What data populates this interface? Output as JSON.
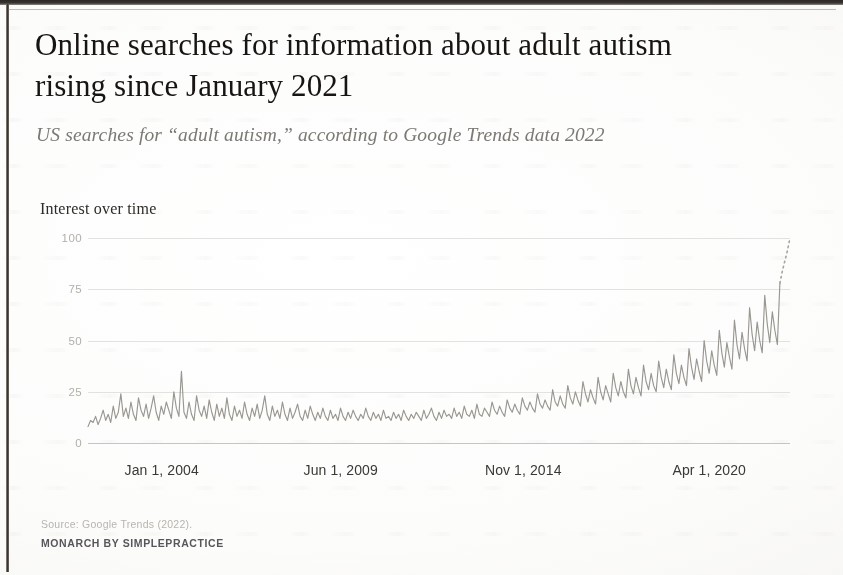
{
  "page": {
    "title_line1": "Online searches for information about adult autism",
    "title_line2": "rising since January 2021",
    "subtitle": "US searches for “adult autism,” according to Google Trends data 2022",
    "chart_caption": "Interest over time",
    "source_note": "Source: Google Trends (2022).",
    "brand_note": "MONARCH BY SIMPLEPRACTICE"
  },
  "colors": {
    "title": "#16120f",
    "subtitle": "#7c7873",
    "line": "#9a9791",
    "grid": "#e6e4e1",
    "axis": "#c9c6c2",
    "ytick": "#b4b0ab",
    "xtick": "#3a3834",
    "source": "#b9b5b0",
    "brand": "#57555a",
    "paper": "#fdfdfc",
    "edge": "#2b2724"
  },
  "chart_data": {
    "type": "line",
    "title": "Interest over time",
    "xlabel": "",
    "ylabel": "Interest over time",
    "ylim": [
      0,
      100
    ],
    "yticks": [
      100,
      75,
      50,
      25,
      0
    ],
    "grid": true,
    "legend": "none",
    "xticks": [
      "Jan 1, 2004",
      "Jun 1, 2009",
      "Nov 1, 2014",
      "Apr 1, 2020"
    ],
    "xtick_positions_pct": [
      10.5,
      36.0,
      62.0,
      88.5
    ],
    "x_start": "Jan 1, 2004",
    "x_end": "2022",
    "annotation": "Final segment drawn as a dotted line (partial/incomplete data), rising to 100.",
    "series": [
      {
        "name": "US search interest for \"adult autism\"",
        "style": "solid",
        "values": [
          8,
          11,
          10,
          13,
          9,
          12,
          16,
          11,
          14,
          10,
          18,
          12,
          15,
          24,
          13,
          17,
          12,
          20,
          14,
          11,
          22,
          16,
          13,
          19,
          12,
          17,
          23,
          15,
          11,
          18,
          14,
          20,
          16,
          12,
          25,
          17,
          13,
          35,
          15,
          12,
          20,
          14,
          11,
          23,
          16,
          13,
          18,
          12,
          21,
          15,
          11,
          19,
          13,
          17,
          12,
          22,
          14,
          11,
          18,
          13,
          16,
          12,
          20,
          14,
          11,
          17,
          13,
          19,
          12,
          16,
          23,
          14,
          11,
          18,
          13,
          16,
          12,
          20,
          14,
          11,
          17,
          12,
          15,
          19,
          13,
          11,
          16,
          12,
          18,
          14,
          11,
          15,
          12,
          17,
          13,
          11,
          16,
          12,
          14,
          11,
          17,
          13,
          11,
          15,
          12,
          16,
          13,
          11,
          14,
          12,
          17,
          13,
          11,
          15,
          12,
          14,
          11,
          16,
          12,
          13,
          11,
          15,
          12,
          14,
          11,
          16,
          13,
          11,
          14,
          12,
          15,
          13,
          11,
          16,
          12,
          14,
          17,
          13,
          11,
          15,
          12,
          16,
          13,
          14,
          12,
          17,
          13,
          15,
          12,
          18,
          14,
          13,
          16,
          12,
          19,
          14,
          13,
          17,
          15,
          13,
          20,
          16,
          14,
          18,
          15,
          13,
          21,
          17,
          15,
          19,
          16,
          14,
          22,
          18,
          16,
          20,
          17,
          15,
          24,
          19,
          17,
          21,
          18,
          16,
          26,
          20,
          18,
          23,
          19,
          17,
          28,
          22,
          19,
          25,
          21,
          18,
          30,
          24,
          20,
          26,
          22,
          19,
          32,
          25,
          21,
          28,
          24,
          20,
          34,
          27,
          23,
          30,
          25,
          22,
          36,
          28,
          24,
          32,
          27,
          23,
          38,
          30,
          26,
          34,
          28,
          25,
          40,
          32,
          27,
          36,
          30,
          26,
          43,
          34,
          29,
          38,
          32,
          28,
          46,
          37,
          31,
          41,
          35,
          30,
          50,
          40,
          34,
          45,
          38,
          33,
          55,
          44,
          37,
          49,
          42,
          36,
          60,
          48,
          41,
          54,
          46,
          40,
          66,
          53,
          45,
          59,
          50,
          44,
          72,
          58,
          49,
          64,
          55,
          48,
          78
        ]
      },
      {
        "name": "partial data (projected tail)",
        "style": "dotted",
        "values": [
          78,
          84,
          89,
          94,
          100
        ]
      }
    ]
  }
}
